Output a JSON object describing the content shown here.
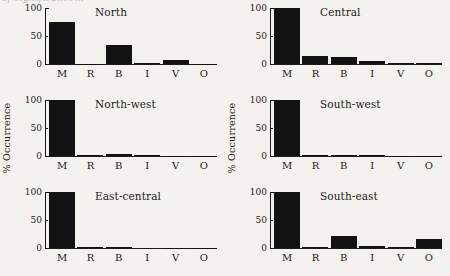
{
  "figure": {
    "scan_artifact_text": "of significance... ",
    "ylabel": "% Occurrence",
    "categories": [
      "M",
      "R",
      "B",
      "I",
      "V",
      "O"
    ],
    "yticks": [
      "100",
      "50",
      "0"
    ],
    "ylim": [
      0,
      100
    ]
  },
  "chart_data": {
    "type": "bar",
    "xlabel": "",
    "ylabel": "% Occurrence",
    "ylim": [
      0,
      100
    ],
    "yticks": [
      0,
      50,
      100
    ],
    "grid": false,
    "legend": false,
    "categories": [
      "M",
      "R",
      "B",
      "I",
      "V",
      "O"
    ],
    "panels": [
      {
        "title": "North",
        "position": "top-left",
        "show_ylabel": false,
        "values": [
          75,
          0.5,
          34,
          1.5,
          7,
          0.5
        ]
      },
      {
        "title": "Central",
        "position": "top-right",
        "show_ylabel": false,
        "values": [
          100,
          14,
          12,
          5,
          1,
          1
        ]
      },
      {
        "title": "North-west",
        "position": "middle-left",
        "show_ylabel": true,
        "values": [
          100,
          2,
          3,
          2,
          0.5,
          0.5
        ]
      },
      {
        "title": "South-west",
        "position": "middle-right",
        "show_ylabel": true,
        "values": [
          100,
          1,
          1.5,
          1,
          0.5,
          0.5
        ]
      },
      {
        "title": "East-central",
        "position": "bottom-left",
        "show_ylabel": false,
        "values": [
          100,
          1.5,
          2,
          0,
          0.5,
          0.5
        ]
      },
      {
        "title": "South-east",
        "position": "bottom-right",
        "show_ylabel": false,
        "values": [
          100,
          1,
          22,
          3,
          1,
          16
        ]
      }
    ]
  },
  "colors": {
    "bar": "#121212",
    "axis": "#1a1a1a",
    "background": "#f4f2ee",
    "text": "#1a1a1a"
  }
}
